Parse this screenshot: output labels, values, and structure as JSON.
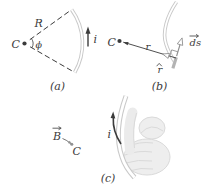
{
  "figure": {
    "background": "#ffffff",
    "colors": {
      "ink": "#3b3b3b",
      "wire": "#c9c9c9",
      "wire-core": "#ffffff",
      "vector-gray": "#8f8f8f",
      "element-gray": "#b3b3b3",
      "hand-fill": "#eeeeee",
      "hand-line": "#dadada",
      "pointer-gray": "#909090"
    },
    "panel_a": {
      "caption": "(a)",
      "center_label": "C",
      "radius_label": "R",
      "angle_label": "ϕ",
      "current_label": "i"
    },
    "panel_b": {
      "caption": "(b)",
      "center_label": "C",
      "distance_label": "r",
      "unit_vector_label": "r",
      "element_label": "ds"
    },
    "panel_c": {
      "caption": "(c)",
      "field_label": "B",
      "center_label": "C",
      "current_label": "i"
    }
  }
}
